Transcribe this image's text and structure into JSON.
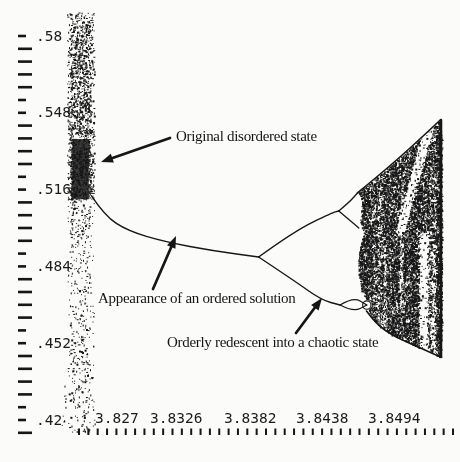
{
  "figure": {
    "background": "#fbfbf9",
    "ink": "#161616"
  },
  "annotations": {
    "disordered": {
      "text": "Original disordered state",
      "x": 176,
      "y": 128,
      "arrow": {
        "tail": [
          170,
          138
        ],
        "tip": [
          101,
          162
        ]
      }
    },
    "ordered": {
      "text": "Appearance of an ordered solution",
      "x": 98,
      "y": 290,
      "arrow": {
        "tail": [
          153,
          289
        ],
        "tip": [
          176,
          236
        ]
      }
    },
    "redescent": {
      "text": "Orderly redescent into a chaotic state",
      "x": 167,
      "y": 334,
      "arrow": {
        "tail": [
          296,
          333
        ],
        "tip": [
          322,
          298
        ]
      }
    }
  },
  "chart_data": {
    "type": "scatter",
    "subtype": "bifurcation-diagram",
    "title": "",
    "xlabel": "",
    "ylabel": "",
    "grid": false,
    "x_ticks": {
      "labels": [
        "3.827",
        "3.8326",
        "3.8382",
        "3.8438",
        "3.8494"
      ],
      "values": [
        3.827,
        3.8326,
        3.8382,
        3.8438,
        3.8494
      ],
      "minor_step": 0.0007
    },
    "y_ticks": {
      "labels": [
        ".58",
        ".548",
        ".516",
        ".484",
        ".452",
        ".42"
      ],
      "values": [
        0.58,
        0.548,
        0.516,
        0.484,
        0.452,
        0.42
      ],
      "minor_step": 0.00533
    },
    "x_range": [
      3.8198,
      3.8542
    ],
    "y_range": [
      0.4025,
      0.595
    ],
    "series": {
      "chaotic_band": {
        "r_min": 3.8248,
        "r_max": 3.8267,
        "v_min": 0.416,
        "v_max": 0.589,
        "dense_core_v": [
          0.513,
          0.537
        ]
      },
      "main_branch": [
        [
          3.8266,
          0.5133
        ],
        [
          3.8276,
          0.505
        ],
        [
          3.8293,
          0.4988
        ],
        [
          3.8321,
          0.4942
        ],
        [
          3.8358,
          0.4904
        ],
        [
          3.8391,
          0.4879
        ]
      ],
      "upper_branch": [
        [
          3.8391,
          0.4879
        ],
        [
          3.8418,
          0.4988
        ],
        [
          3.8446,
          0.5063
        ],
        [
          3.8451,
          0.5071
        ]
      ],
      "upper_fork_top": [
        [
          3.8451,
          0.5071
        ],
        [
          3.8459,
          0.5108
        ],
        [
          3.8465,
          0.5146
        ]
      ],
      "upper_fork_bottom": [
        [
          3.8451,
          0.5071
        ],
        [
          3.846,
          0.5029
        ],
        [
          3.8466,
          0.5
        ]
      ],
      "lower_branch": [
        [
          3.8391,
          0.4879
        ],
        [
          3.8418,
          0.4779
        ],
        [
          3.8438,
          0.47
        ],
        [
          3.8452,
          0.4679
        ]
      ],
      "lower_eye_top": [
        [
          3.8452,
          0.4679
        ],
        [
          3.8462,
          0.4713
        ],
        [
          3.8472,
          0.4679
        ]
      ],
      "lower_eye_bottom": [
        [
          3.8452,
          0.4679
        ],
        [
          3.8462,
          0.465
        ],
        [
          3.8472,
          0.4679
        ]
      ],
      "chaotic_wedge": {
        "apex": [
          3.8527,
          0.545
        ],
        "left_top": [
          3.8465,
          0.5146
        ],
        "left_bottom": [
          3.847,
          0.468
        ],
        "bottom_right": [
          3.8527,
          0.4463
        ],
        "right_edge_r": 3.8528
      }
    }
  }
}
